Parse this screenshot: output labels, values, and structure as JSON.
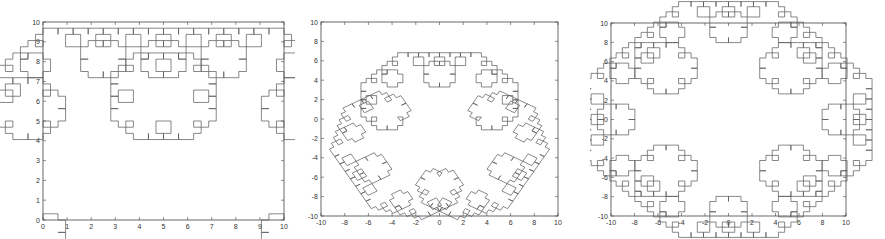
{
  "chart_data": [
    {
      "type": "line",
      "title": "",
      "description": "Levy C curve fractal from (0,0) to (10,0), peak at (5,5)",
      "xlabel": "",
      "ylabel": "",
      "xlim": [
        0,
        10
      ],
      "ylim": [
        0,
        10
      ],
      "xticks": [
        "0",
        "1",
        "2",
        "3",
        "4",
        "5",
        "6",
        "7",
        "8",
        "9",
        "10"
      ],
      "yticks": [
        "0",
        "1",
        "2",
        "3",
        "4",
        "5",
        "6",
        "7",
        "8",
        "9",
        "10"
      ],
      "grid": false,
      "curve": {
        "kind": "levy",
        "start": [
          0,
          0
        ],
        "end": [
          10,
          0
        ],
        "level": 10
      },
      "box": {
        "left": 43,
        "top": 22,
        "right": 284,
        "bottom": 220
      }
    },
    {
      "type": "line",
      "title": "",
      "description": "Closed fractal snowflake (triangular base, curled lobes)",
      "xlabel": "",
      "ylabel": "",
      "xlim": [
        -10,
        10
      ],
      "ylim": [
        -10,
        10
      ],
      "xticks": [
        "-10",
        "-8",
        "-6",
        "-4",
        "-2",
        "0",
        "2",
        "4",
        "6",
        "8",
        "10"
      ],
      "yticks": [
        "-10",
        "-8",
        "-6",
        "-4",
        "-2",
        "0",
        "2",
        "4",
        "6",
        "8",
        "10"
      ],
      "grid": false,
      "curve": {
        "kind": "levy-polygon",
        "vertices": [
          [
            0,
            -8.4
          ],
          [
            -5.7,
            1.5
          ],
          [
            5.7,
            1.5
          ]
        ],
        "level": 8,
        "scale": 0.62,
        "center": [
          0,
          -1.9
        ]
      },
      "box": {
        "left": 321,
        "top": 22,
        "right": 558,
        "bottom": 216
      }
    },
    {
      "type": "line",
      "title": "",
      "description": "Closed fractal diamond (square base), extremes at (+-8.5,0),(0,+-8.5)",
      "xlabel": "",
      "ylabel": "",
      "xlim": [
        -10,
        10
      ],
      "ylim": [
        -10,
        10
      ],
      "xticks": [
        "-10",
        "-8",
        "-6",
        "-4",
        "-2",
        "0",
        "2",
        "4",
        "6",
        "8",
        "10"
      ],
      "yticks": [
        "-10",
        "-8",
        "-6",
        "-4",
        "-2",
        "0",
        "2",
        "4",
        "6",
        "8",
        "10"
      ],
      "grid": false,
      "curve": {
        "kind": "levy-polygon",
        "vertices": [
          [
            -4.25,
            4.25
          ],
          [
            4.25,
            4.25
          ],
          [
            4.25,
            -4.25
          ],
          [
            -4.25,
            -4.25
          ]
        ],
        "level": 8,
        "scale": 1,
        "center": [
          0,
          0
        ]
      },
      "box": {
        "left": 611,
        "top": 23,
        "right": 846,
        "bottom": 216
      }
    }
  ],
  "colors": {
    "axis": "#444444",
    "curve": "#555555",
    "background": "#ffffff"
  }
}
